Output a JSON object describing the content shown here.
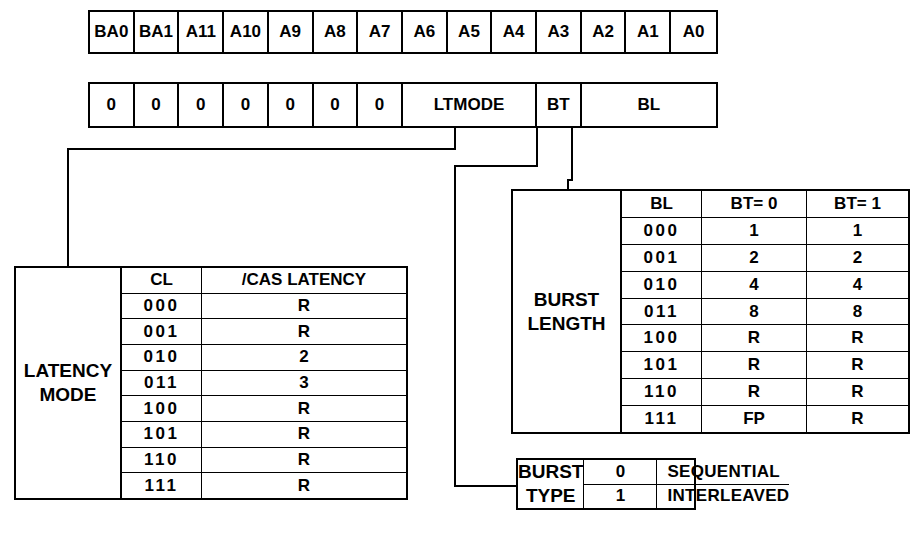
{
  "diagram": {
    "address_row": {
      "name": "address-bits",
      "cells": [
        "BA0",
        "BA1",
        "A11",
        "A10",
        "A9",
        "A8",
        "A7",
        "A6",
        "A5",
        "A4",
        "A3",
        "A2",
        "A1",
        "A0"
      ]
    },
    "mode_row": {
      "name": "mode-register-fields",
      "cells": [
        {
          "label": "0",
          "span": 1
        },
        {
          "label": "0",
          "span": 1
        },
        {
          "label": "0",
          "span": 1
        },
        {
          "label": "0",
          "span": 1
        },
        {
          "label": "0",
          "span": 1
        },
        {
          "label": "0",
          "span": 1
        },
        {
          "label": "0",
          "span": 1
        },
        {
          "label": "LTMODE",
          "span": 3
        },
        {
          "label": "BT",
          "span": 1
        },
        {
          "label": "BL",
          "span": 3
        }
      ]
    },
    "latency_mode": {
      "label_lines": [
        "LATENCY",
        "MODE"
      ],
      "headers": [
        "CL",
        "/CAS LATENCY"
      ],
      "rows": [
        [
          "000",
          "R"
        ],
        [
          "001",
          "R"
        ],
        [
          "010",
          "2"
        ],
        [
          "011",
          "3"
        ],
        [
          "100",
          "R"
        ],
        [
          "101",
          "R"
        ],
        [
          "110",
          "R"
        ],
        [
          "111",
          "R"
        ]
      ]
    },
    "burst_length": {
      "label_lines": [
        "BURST",
        "LENGTH"
      ],
      "headers": [
        "BL",
        "BT= 0",
        "BT= 1"
      ],
      "rows": [
        [
          "000",
          "1",
          "1"
        ],
        [
          "001",
          "2",
          "2"
        ],
        [
          "010",
          "4",
          "4"
        ],
        [
          "011",
          "8",
          "8"
        ],
        [
          "100",
          "R",
          "R"
        ],
        [
          "101",
          "R",
          "R"
        ],
        [
          "110",
          "R",
          "R"
        ],
        [
          "111",
          "FP",
          "R"
        ]
      ]
    },
    "burst_type": {
      "label_lines": [
        "BURST",
        "TYPE"
      ],
      "rows": [
        [
          "0",
          "SEQUENTIAL"
        ],
        [
          "1",
          "INTERLEAVED"
        ]
      ]
    },
    "colors": {
      "ink": "#000000",
      "paper": "#ffffff"
    }
  }
}
